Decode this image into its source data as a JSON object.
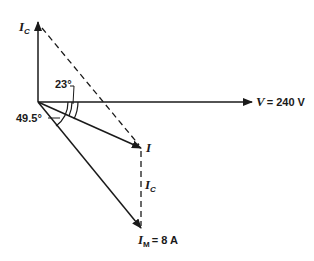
{
  "diagram": {
    "type": "phasor-diagram",
    "colors": {
      "stroke": "#1a1a1a",
      "background": "#ffffff"
    },
    "origin": [
      38,
      102
    ],
    "phasors": [
      {
        "name": "V",
        "label": "V",
        "value_text": "= 240 V",
        "tip": [
          252,
          102
        ]
      },
      {
        "name": "Ic",
        "label": "I",
        "sub": "C",
        "tip": [
          38,
          22
        ]
      },
      {
        "name": "I",
        "label": "I",
        "tip": [
          141,
          148
        ]
      },
      {
        "name": "IM",
        "label": "I",
        "sub": "M",
        "value_text": "= 8 A",
        "tip": [
          141,
          228
        ]
      }
    ],
    "dashed": [
      {
        "name": "Ic-projection-top",
        "from": [
          40,
          26
        ],
        "to": [
          141,
          148
        ]
      },
      {
        "name": "Ic-projection-vertical",
        "from": [
          141,
          150
        ],
        "to": [
          141,
          228
        ],
        "label": "I",
        "sub": "C"
      }
    ],
    "angles": [
      {
        "label": "23°"
      },
      {
        "label": "49.5°"
      }
    ]
  }
}
